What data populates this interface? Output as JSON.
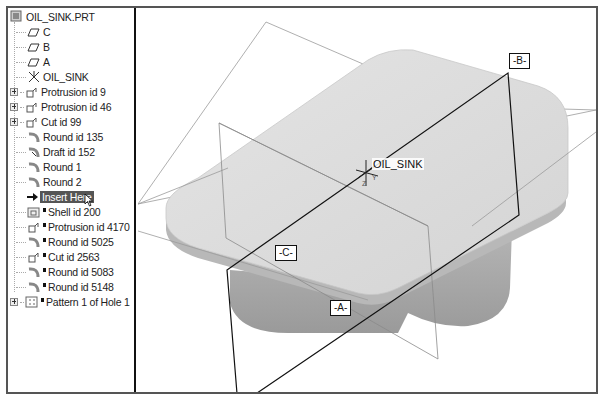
{
  "model_tree": {
    "root": "OIL_SINK.PRT",
    "items": [
      {
        "label": "C",
        "icon": "datum-plane-icon",
        "expandable": false,
        "new": false
      },
      {
        "label": "B",
        "icon": "datum-plane-icon",
        "expandable": false,
        "new": false
      },
      {
        "label": "A",
        "icon": "datum-plane-icon",
        "expandable": false,
        "new": false
      },
      {
        "label": "OIL_SINK",
        "icon": "coordinate-system-icon",
        "expandable": false,
        "new": false
      },
      {
        "label": "Protrusion id 9",
        "icon": "protrusion-icon",
        "expandable": true,
        "new": false
      },
      {
        "label": "Protrusion id 46",
        "icon": "protrusion-icon",
        "expandable": true,
        "new": false
      },
      {
        "label": "Cut id 99",
        "icon": "cut-icon",
        "expandable": true,
        "new": false
      },
      {
        "label": "Round id 135",
        "icon": "round-icon",
        "expandable": false,
        "new": false
      },
      {
        "label": "Draft id 152",
        "icon": "draft-icon",
        "expandable": false,
        "new": false
      },
      {
        "label": "Round 1",
        "icon": "round-icon",
        "expandable": false,
        "new": false
      },
      {
        "label": "Round 2",
        "icon": "round-icon",
        "expandable": false,
        "new": false
      },
      {
        "label": "Insert Here",
        "icon": "insert-arrow-icon",
        "expandable": false,
        "new": false,
        "highlight": true
      },
      {
        "label": "Shell id 200",
        "icon": "shell-icon",
        "expandable": false,
        "new": true
      },
      {
        "label": "Protrusion id 4170",
        "icon": "protrusion-icon",
        "expandable": false,
        "new": true
      },
      {
        "label": "Round id 5025",
        "icon": "round-icon",
        "expandable": false,
        "new": true
      },
      {
        "label": "Cut id 2563",
        "icon": "cut-icon",
        "expandable": false,
        "new": true
      },
      {
        "label": "Round id 5083",
        "icon": "round-icon",
        "expandable": false,
        "new": true
      },
      {
        "label": "Round id 5148",
        "icon": "round-icon",
        "expandable": false,
        "new": true
      },
      {
        "label": "Pattern 1 of Hole 1",
        "icon": "pattern-icon",
        "expandable": true,
        "new": true
      }
    ]
  },
  "viewport": {
    "datum_tags": {
      "b": "-B-",
      "c": "-C-",
      "a": "-A-"
    },
    "csys_label": "OIL_SINK",
    "csys_axes": {
      "z": "Z",
      "y": "Y"
    }
  },
  "colors": {
    "part_top": "#dcdcdc",
    "part_side": "#a8a8a8",
    "datum_line": "#111111",
    "plane_line": "#888888",
    "highlight": "#555555"
  }
}
